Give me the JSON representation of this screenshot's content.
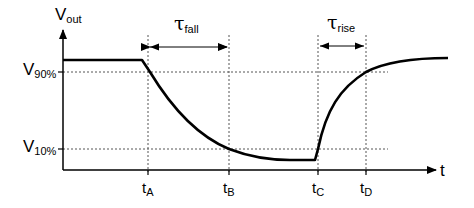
{
  "diagram": {
    "y_axis": {
      "symbol": "V",
      "subscript": "out"
    },
    "x_axis": {
      "symbol": "t"
    },
    "levels": [
      {
        "symbol": "V",
        "subscript": "90%"
      },
      {
        "symbol": "V",
        "subscript": "10%"
      }
    ],
    "time_marks": [
      {
        "symbol": "t",
        "subscript": "A"
      },
      {
        "symbol": "t",
        "subscript": "B"
      },
      {
        "symbol": "t",
        "subscript": "C"
      },
      {
        "symbol": "t",
        "subscript": "D"
      }
    ],
    "intervals": [
      {
        "symbol": "τ",
        "subscript": "fall"
      },
      {
        "symbol": "τ",
        "subscript": "rise"
      }
    ],
    "colors": {
      "line": "#000000",
      "dashed": "#555555",
      "background": "#ffffff"
    }
  }
}
